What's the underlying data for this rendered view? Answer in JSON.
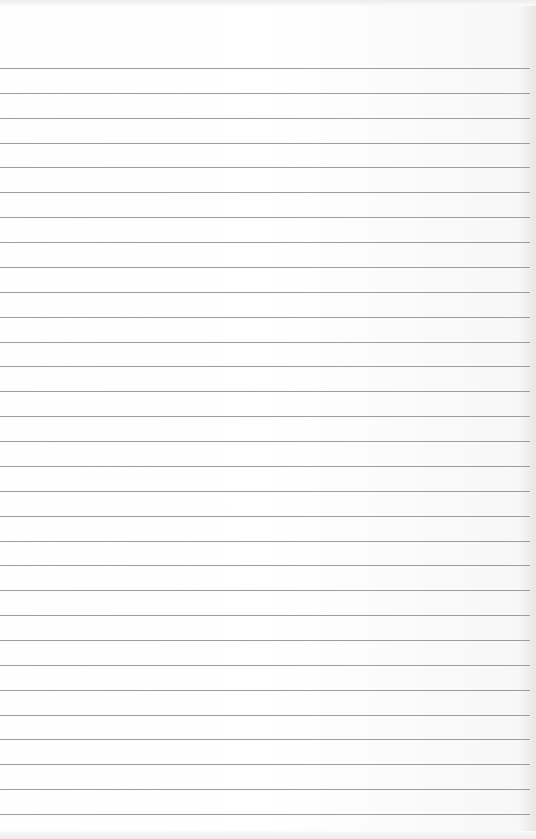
{
  "page": {
    "type": "lined-paper",
    "text": "",
    "line_count": 31,
    "first_line_y": 68,
    "line_spacing": 24.87,
    "line_color": "#8c8c8c",
    "paper_color": "#fdfdfd"
  }
}
